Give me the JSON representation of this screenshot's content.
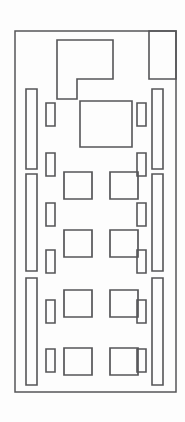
{
  "canvas": {
    "width": 185,
    "height": 422,
    "background_color": "#fdfdfd",
    "stroke_color": "#555558",
    "title": "schematic-line-drawing"
  },
  "drawing": {
    "type": "technical-line-drawing",
    "description": "Monochrome outline floor-plan / layout diagram composed of nested rectangles, elongated bars and small slots inside a tall portrait frame",
    "outer_frame": {
      "name": "outer-frame",
      "x": 15,
      "y": 31,
      "width": 161,
      "height": 361
    },
    "top_notched_block": {
      "name": "notched-polygon",
      "points": "57,40 113,40 113,79 77,79 77,99 57,99"
    },
    "top_right_block": {
      "name": "top-right-rectangle",
      "x": 149,
      "y": 31,
      "width": 27,
      "height": 48
    },
    "center_main_block": {
      "name": "center-main-rectangle",
      "x": 80,
      "y": 101,
      "width": 52,
      "height": 46
    },
    "left_bars": [
      {
        "name": "left-bar-upper",
        "x": 26,
        "y": 89,
        "width": 11,
        "height": 80
      },
      {
        "name": "left-bar-middle",
        "x": 26,
        "y": 174,
        "width": 11,
        "height": 97
      },
      {
        "name": "left-bar-lower",
        "x": 26,
        "y": 278,
        "width": 11,
        "height": 107
      }
    ],
    "right_bars": [
      {
        "name": "right-bar-upper",
        "x": 152,
        "y": 89,
        "width": 11,
        "height": 80
      },
      {
        "name": "right-bar-middle",
        "x": 152,
        "y": 174,
        "width": 11,
        "height": 97
      },
      {
        "name": "right-bar-lower",
        "x": 152,
        "y": 278,
        "width": 11,
        "height": 107
      }
    ],
    "left_slots": [
      {
        "name": "left-slot-1",
        "x": 46,
        "y": 103,
        "width": 9,
        "height": 23
      },
      {
        "name": "left-slot-2",
        "x": 46,
        "y": 153,
        "width": 9,
        "height": 23
      },
      {
        "name": "left-slot-3",
        "x": 46,
        "y": 203,
        "width": 9,
        "height": 23
      },
      {
        "name": "left-slot-4",
        "x": 46,
        "y": 250,
        "width": 9,
        "height": 23
      },
      {
        "name": "left-slot-5",
        "x": 46,
        "y": 300,
        "width": 9,
        "height": 23
      },
      {
        "name": "left-slot-6",
        "x": 46,
        "y": 349,
        "width": 9,
        "height": 23
      }
    ],
    "right_slots": [
      {
        "name": "right-slot-1",
        "x": 137,
        "y": 103,
        "width": 9,
        "height": 23
      },
      {
        "name": "right-slot-2",
        "x": 137,
        "y": 153,
        "width": 9,
        "height": 23
      },
      {
        "name": "right-slot-3",
        "x": 137,
        "y": 203,
        "width": 9,
        "height": 23
      },
      {
        "name": "right-slot-4",
        "x": 137,
        "y": 250,
        "width": 9,
        "height": 23
      },
      {
        "name": "right-slot-5",
        "x": 137,
        "y": 300,
        "width": 9,
        "height": 23
      },
      {
        "name": "right-slot-6",
        "x": 137,
        "y": 349,
        "width": 9,
        "height": 23
      }
    ],
    "unit_squares": [
      {
        "name": "unit-square-r1-left",
        "x": 64,
        "y": 172,
        "width": 28,
        "height": 27
      },
      {
        "name": "unit-square-r1-right",
        "x": 110,
        "y": 172,
        "width": 28,
        "height": 27
      },
      {
        "name": "unit-square-r2-left",
        "x": 64,
        "y": 230,
        "width": 28,
        "height": 27
      },
      {
        "name": "unit-square-r2-right",
        "x": 110,
        "y": 230,
        "width": 28,
        "height": 27
      },
      {
        "name": "unit-square-r3-left",
        "x": 64,
        "y": 290,
        "width": 28,
        "height": 27
      },
      {
        "name": "unit-square-r3-right",
        "x": 110,
        "y": 290,
        "width": 28,
        "height": 27
      },
      {
        "name": "unit-square-r4-left",
        "x": 64,
        "y": 348,
        "width": 28,
        "height": 27
      },
      {
        "name": "unit-square-r4-right",
        "x": 110,
        "y": 348,
        "width": 28,
        "height": 27
      }
    ]
  }
}
